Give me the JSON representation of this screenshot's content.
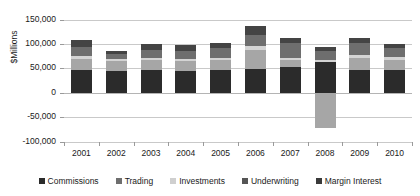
{
  "chart_data": {
    "type": "bar",
    "stacked": true,
    "title": "",
    "subtitle": "",
    "xlabel": "",
    "ylabel": "$Millions",
    "ylim": [
      -100000,
      150000
    ],
    "ytick_labels": [
      "150,000",
      "100,000",
      "50,000",
      "0",
      "-50,000",
      "-100,000"
    ],
    "ytick_values": [
      150000,
      100000,
      50000,
      0,
      -50000,
      -100000
    ],
    "grid": true,
    "legend_position": "bottom",
    "categories": [
      "2001",
      "2002",
      "2003",
      "2004",
      "2005",
      "2006",
      "2007",
      "2008",
      "2009",
      "2010"
    ],
    "series": [
      {
        "name": "Commissions",
        "color": "#2b2b2b",
        "values": [
          47000,
          45000,
          46000,
          45000,
          46000,
          48000,
          53000,
          62000,
          47000,
          46000
        ]
      },
      {
        "name": "Trading",
        "color": "#a6a6a6",
        "values": [
          23000,
          20000,
          20000,
          20000,
          21000,
          40000,
          14000,
          -72000,
          24000,
          22000
        ]
      },
      {
        "name": "Investments",
        "color": "#d4d4d4",
        "values": [
          6000,
          5000,
          5000,
          5000,
          5000,
          7000,
          5000,
          4000,
          6000,
          5000
        ]
      },
      {
        "name": "Underwriting",
        "color": "#6e6e6e",
        "values": [
          18000,
          9000,
          17000,
          16000,
          20000,
          23000,
          29000,
          19000,
          24000,
          19000
        ]
      },
      {
        "name": "Margin Interest",
        "color": "#444444",
        "values": [
          13000,
          7000,
          12000,
          12000,
          10000,
          18000,
          12000,
          9000,
          12000,
          8000
        ]
      }
    ]
  },
  "legend": {
    "items": [
      {
        "label": "Commissions",
        "color": "#2b2b2b"
      },
      {
        "label": "Trading",
        "color": "#6e6e6e"
      },
      {
        "label": "Investments",
        "color": "#cfcfcf"
      },
      {
        "label": "Underwriting",
        "color": "#555555"
      },
      {
        "label": "Margin Interest",
        "color": "#3a3a3a"
      }
    ]
  }
}
